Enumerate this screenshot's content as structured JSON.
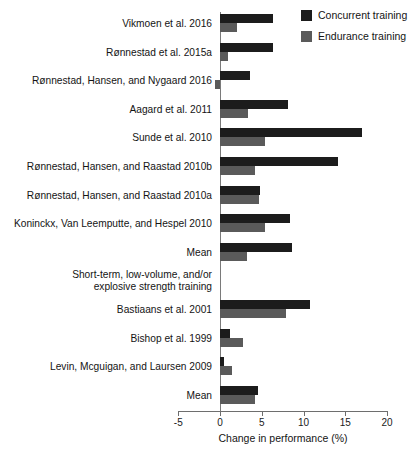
{
  "chart_data": {
    "type": "bar",
    "orientation": "horizontal",
    "title": "",
    "xlabel": "Change in performance (%)",
    "ylabel": "",
    "xlim": [
      -5,
      20
    ],
    "xticks": [
      -5,
      0,
      5,
      10,
      15,
      20
    ],
    "xtick_labels": [
      "-5",
      "0",
      "5",
      "10",
      "15",
      "20"
    ],
    "grid": false,
    "legend": {
      "position": "top-right",
      "entries": [
        {
          "name": "Concurrent training",
          "color": "#1c1c1c"
        },
        {
          "name": "Endurance training",
          "color": "#5a5a5a"
        }
      ]
    },
    "categories": [
      "Vikmoen et al. 2016",
      "Rønnestad et al. 2015a",
      "Rønnestad, Hansen, and Nygaard 2016",
      "Aagard et al. 2011",
      "Sunde et al. 2010",
      "Rønnestad, Hansen, and Raastad 2010b",
      "Rønnestad, Hansen, and Raastad 2010a",
      "Koninckx, Van Leemputte, and Hespel 2010",
      "Mean",
      "Short-term, low-volume, and/or\nexplosive strength training",
      "Bastiaans et al. 2001",
      "Bishop et al. 1999",
      "Levin, Mcguigan, and Laursen 2009",
      "Mean"
    ],
    "series": [
      {
        "name": "Concurrent training",
        "color": "#1c1c1c",
        "values": [
          6.3,
          6.3,
          3.6,
          8.1,
          17.0,
          14.1,
          4.8,
          8.4,
          8.6,
          null,
          10.8,
          1.2,
          0.5,
          4.5
        ]
      },
      {
        "name": "Endurance training",
        "color": "#5a5a5a",
        "values": [
          2.0,
          0.9,
          -0.6,
          3.3,
          5.4,
          4.2,
          4.7,
          5.4,
          3.2,
          null,
          7.9,
          2.8,
          1.4,
          4.2
        ]
      }
    ],
    "section_header_index": 9
  },
  "legend": {
    "items": [
      {
        "label": "Concurrent training"
      },
      {
        "label": "Endurance training"
      }
    ]
  },
  "axis": {
    "x_title": "Change in performance (%)",
    "ticks": [
      "-5",
      "0",
      "5",
      "10",
      "15",
      "20"
    ]
  },
  "rows": [
    {
      "label": "Vikmoen et al. 2016"
    },
    {
      "label": "Rønnestad et al. 2015a"
    },
    {
      "label": "Rønnestad, Hansen, and Nygaard 2016"
    },
    {
      "label": "Aagard et al. 2011"
    },
    {
      "label": "Sunde et al. 2010"
    },
    {
      "label": "Rønnestad, Hansen, and Raastad 2010b"
    },
    {
      "label": "Rønnestad, Hansen, and Raastad 2010a"
    },
    {
      "label": "Koninckx, Van Leemputte, and Hespel 2010"
    },
    {
      "label": "Mean"
    },
    {
      "label": "Short-term, low-volume, and/or\nexplosive strength training"
    },
    {
      "label": "Bastiaans et al. 2001"
    },
    {
      "label": "Bishop et al. 1999"
    },
    {
      "label": "Levin, Mcguigan, and Laursen 2009"
    },
    {
      "label": "Mean"
    }
  ]
}
